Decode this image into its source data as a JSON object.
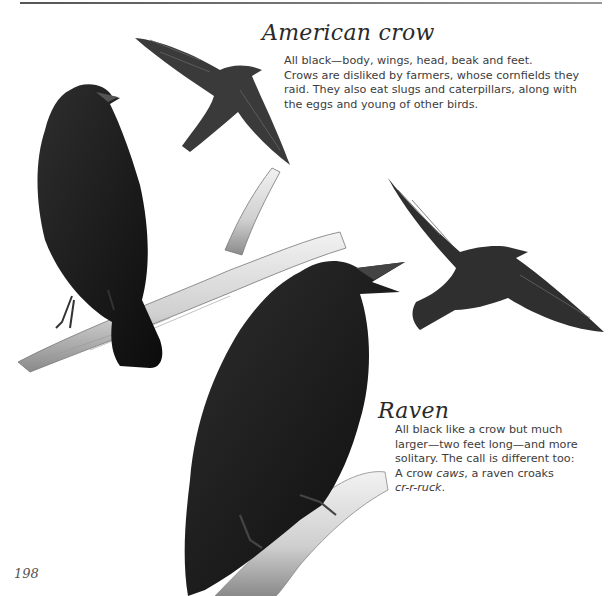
{
  "page": {
    "page_number": "198",
    "illustration_caption_note": ""
  },
  "sections": [
    {
      "heading": "American crow",
      "lines": [
        "All black—body, wings, head, beak and feet.",
        "Crows are disliked by farmers, whose cornfields they",
        "raid. They also eat slugs and caterpillars, along with",
        "the eggs and young of other birds."
      ]
    },
    {
      "heading": "Raven",
      "lines": [
        "All black like a crow but much",
        "larger—two feet long—and more",
        "solitary. The call is different too:"
      ],
      "line4_prefix": "A crow ",
      "line4_em1": "caws",
      "line4_mid": ", a raven croaks",
      "line5_em": "cr-r-ruck",
      "line5_suffix": "."
    }
  ],
  "illustrations": [
    {
      "subject": "perched-crow"
    },
    {
      "subject": "flying-crow-top"
    },
    {
      "subject": "flying-crow-right"
    },
    {
      "subject": "perched-raven"
    }
  ]
}
